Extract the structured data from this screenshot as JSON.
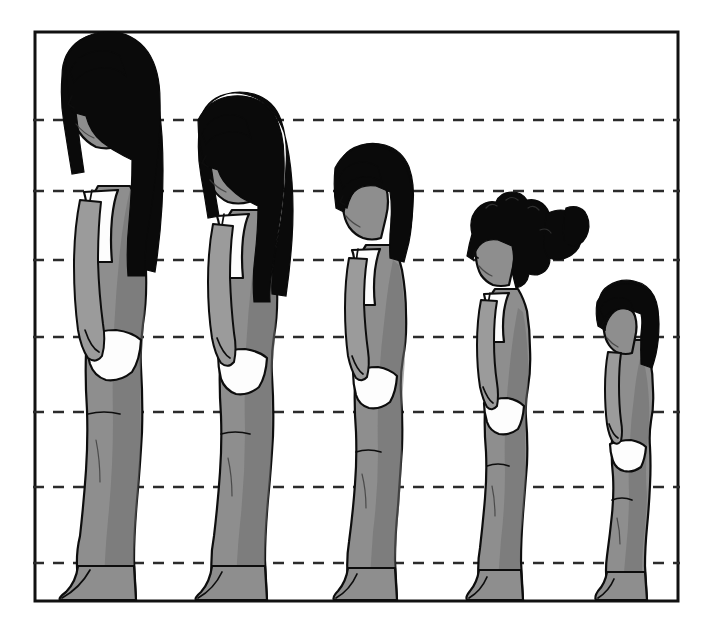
{
  "diagram": {
    "type": "illustration",
    "background_color": "#ffffff",
    "ink_color": "#0d0d0d",
    "skin_tone_color": "#8e8e8e",
    "hair_color": "#0a0a0a",
    "garment_color": "#fdfdfd",
    "dashed_line_color": "#2b2b2b",
    "frame": {
      "label": "diagram-frame",
      "x": 35,
      "y": 32,
      "width": 643,
      "height": 569,
      "stroke_width": 3
    },
    "reference_lines": [
      {
        "id": "ref-line-1",
        "y": 120,
        "note": "chin / jaw level of tallest figure"
      },
      {
        "id": "ref-line-2",
        "y": 191,
        "note": "shoulder level of tallest figure"
      },
      {
        "id": "ref-line-3",
        "y": 260,
        "note": "chest / underarm level"
      },
      {
        "id": "ref-line-4",
        "y": 337,
        "note": "hip / wrist level"
      },
      {
        "id": "ref-line-5",
        "y": 412,
        "note": "mid thigh level"
      },
      {
        "id": "ref-line-6",
        "y": 487,
        "note": "knee level"
      },
      {
        "id": "ref-line-7",
        "y": 563,
        "note": "ankle level"
      }
    ],
    "baseline_y": 598,
    "figures": [
      {
        "id": "figure-1",
        "order": 1,
        "stage_label": "Adolescent / teen",
        "facing": "left",
        "hair_style": "long straight hair with fringe, past shoulders",
        "garment": "briefs and camisole top",
        "head_top_y": 36,
        "ground_y": 598,
        "relative_height": 1.0,
        "center_x": 105
      },
      {
        "id": "figure-2",
        "order": 2,
        "stage_label": "Pre-adolescent",
        "facing": "left",
        "hair_style": "long hair with fringe, shoulder length",
        "garment": "briefs and camisole top",
        "head_top_y": 103,
        "ground_y": 598,
        "relative_height": 0.88,
        "center_x": 239
      },
      {
        "id": "figure-3",
        "order": 3,
        "stage_label": "School age child",
        "facing": "left",
        "hair_style": "short bob with fringe",
        "garment": "briefs and camisole top",
        "head_top_y": 155,
        "ground_y": 598,
        "relative_height": 0.78,
        "center_x": 372
      },
      {
        "id": "figure-4",
        "order": 4,
        "stage_label": "Young child",
        "facing": "left",
        "hair_style": "curly hair tied in a side ponytail",
        "garment": "briefs and camisole top",
        "head_top_y": 210,
        "ground_y": 598,
        "relative_height": 0.68,
        "center_x": 503
      },
      {
        "id": "figure-5",
        "order": 5,
        "stage_label": "Toddler",
        "facing": "left",
        "hair_style": "short cropped hair",
        "garment": "briefs",
        "head_top_y": 288,
        "ground_y": 598,
        "relative_height": 0.54,
        "center_x": 628
      }
    ]
  }
}
